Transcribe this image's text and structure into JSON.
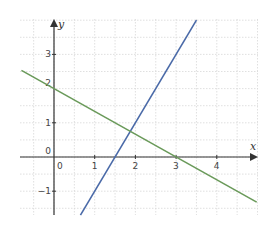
{
  "chart_data": {
    "type": "line",
    "title": "",
    "xlabel": "x",
    "ylabel": "y",
    "xlim": [
      -0.85,
      4.95
    ],
    "ylim": [
      -1.7,
      4.0
    ],
    "grid": true,
    "grid_step": 0.5,
    "x_ticks": [
      0,
      1,
      2,
      3,
      4
    ],
    "x_tick_labels": [
      "0",
      "1",
      "2",
      "3",
      "4"
    ],
    "y_ticks": [
      -1,
      1,
      3
    ],
    "y_tick_labels": [
      "−1",
      "1",
      "3"
    ],
    "y_extra_labels": [
      {
        "value": 0,
        "label": "0"
      },
      {
        "value": 2,
        "label": "2"
      }
    ],
    "series": [
      {
        "name": "line-blue",
        "equation": "y = 2x - 3",
        "slope": 2,
        "intercept": -3,
        "x": [
          0.65,
          3.5
        ],
        "y": [
          -1.7,
          4.0
        ],
        "color": "#4a6aa8"
      },
      {
        "name": "line-green",
        "equation": "y = -2x/3 + 2",
        "slope": -0.6667,
        "intercept": 2,
        "x": [
          -0.8,
          4.98
        ],
        "y": [
          2.533,
          -1.32
        ],
        "color": "#6a9a5a"
      }
    ],
    "intersection": {
      "x": 1.875,
      "y": 0.75
    },
    "axis_color": "#333333",
    "grid_color": "#d8d8d8"
  }
}
